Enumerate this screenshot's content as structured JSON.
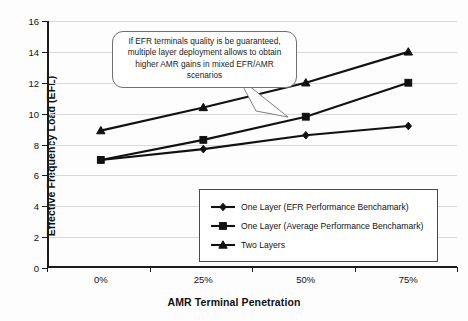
{
  "chart_data": {
    "type": "line",
    "title": "",
    "xlabel": "AMR Terminal Penetration",
    "ylabel": "Effective Frequency Load (EFL)",
    "categories": [
      "0%",
      "25%",
      "50%",
      "75%"
    ],
    "ylim": [
      0,
      16
    ],
    "yticks": [
      0,
      2,
      4,
      6,
      8,
      10,
      12,
      14,
      16
    ],
    "grid": true,
    "legend_position": "inside-lower-right",
    "series": [
      {
        "name": "One Layer (EFR Performance Benchamark)",
        "marker": "diamond",
        "values": [
          7.0,
          7.7,
          8.6,
          9.2
        ]
      },
      {
        "name": "One Layer (Average Performance Benchamark)",
        "marker": "square",
        "values": [
          7.0,
          8.3,
          9.8,
          12.0
        ]
      },
      {
        "name": "Two Layers",
        "marker": "triangle",
        "values": [
          8.9,
          10.4,
          12.0,
          14.0
        ]
      }
    ],
    "annotations": [
      {
        "name": "callout",
        "text": "If EFR terminals quality is be guaranteed, multiple layer deployment allows to obtain higher AMR gains in mixed EFR/AMR scenarios",
        "points_to_series": "Two Layers"
      }
    ],
    "colors": {
      "series": "#111111",
      "grid": "#d8d8d8",
      "axis": "#1b1b1b",
      "background": "#fdfdfd"
    }
  }
}
